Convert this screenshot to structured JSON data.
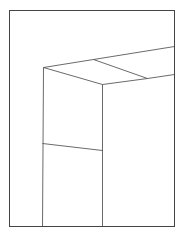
{
  "drawing": {
    "background": "#ffffff",
    "stroke": "#444444",
    "frame": {
      "x1": 9,
      "y1": 10,
      "x2": 174,
      "y2": 226
    },
    "lines": [
      {
        "name": "box-top-back-edge",
        "x1": 43,
        "y1": 67,
        "x2": 93,
        "y2": 59
      },
      {
        "name": "ceiling-far-edge",
        "x1": 93,
        "y1": 59,
        "x2": 174,
        "y2": 46
      },
      {
        "name": "box-top-left-edge",
        "x1": 43,
        "y1": 67,
        "x2": 102,
        "y2": 84
      },
      {
        "name": "ceiling-diagonal",
        "x1": 93,
        "y1": 59,
        "x2": 147,
        "y2": 78
      },
      {
        "name": "box-top-front-edge",
        "x1": 102,
        "y1": 84,
        "x2": 147,
        "y2": 78
      },
      {
        "name": "ceiling-near-edge",
        "x1": 147,
        "y1": 78,
        "x2": 174,
        "y2": 74
      },
      {
        "name": "box-left-vertical",
        "x1": 43,
        "y1": 67,
        "x2": 42,
        "y2": 226
      },
      {
        "name": "box-front-vertical",
        "x1": 102,
        "y1": 84,
        "x2": 102,
        "y2": 226
      },
      {
        "name": "box-middle-line",
        "x1": 42,
        "y1": 143,
        "x2": 102,
        "y2": 150
      }
    ]
  }
}
